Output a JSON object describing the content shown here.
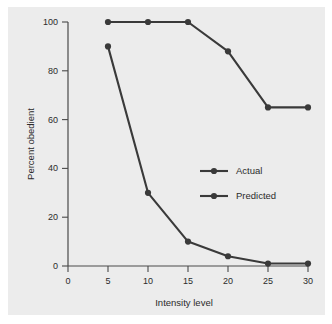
{
  "chart_data": {
    "type": "line",
    "title": "",
    "xlabel": "Intensity level",
    "ylabel": "Percent obedient",
    "x": [
      5,
      10,
      15,
      20,
      25,
      30
    ],
    "xlim": [
      0,
      32
    ],
    "ylim": [
      0,
      104
    ],
    "xticks": [
      0,
      5,
      10,
      15,
      20,
      25,
      30
    ],
    "xtick_labels": [
      "0",
      "5",
      "10",
      "15",
      "20",
      "25",
      "30"
    ],
    "yticks": [
      0,
      20,
      40,
      60,
      80,
      100
    ],
    "ytick_labels": [
      "0",
      "20",
      "40",
      "60",
      "80",
      "100"
    ],
    "grid": false,
    "legend_position": "center-right",
    "series": [
      {
        "name": "Actual",
        "values": [
          90,
          30,
          10,
          4,
          1,
          1
        ],
        "color": "#3a3a3a"
      },
      {
        "name": "Predicted",
        "values": [
          100,
          100,
          100,
          88,
          65,
          65
        ],
        "color": "#3a3a3a"
      }
    ]
  },
  "legend": {
    "entries": [
      {
        "label": "Actual"
      },
      {
        "label": "Predicted"
      }
    ]
  },
  "colors": {
    "panel_background": "#ececec",
    "figure_background": "#ffffff",
    "ink": "#3a3a3a",
    "axis": "#4a4a4a"
  }
}
